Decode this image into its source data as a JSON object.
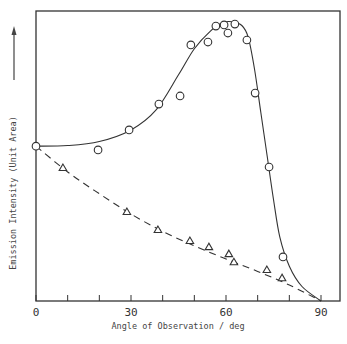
{
  "chart_data": {
    "type": "scatter",
    "title": "",
    "xlabel": "Angle of Observation / deg",
    "ylabel": "Emission Intensity (Unit Area)",
    "xlim": [
      0,
      90
    ],
    "ylim": [
      0,
      100
    ],
    "x_ticks": [
      0,
      10,
      20,
      30,
      40,
      50,
      60,
      70,
      80,
      90
    ],
    "x_tick_labels": [
      "0",
      "30",
      "60",
      "90"
    ],
    "y_ticks": [],
    "grid": false,
    "legend": null,
    "series": [
      {
        "name": "circles",
        "marker": "circle",
        "line": "solid",
        "points": [
          [
            0,
            53.4
          ],
          [
            19.6,
            52.1
          ],
          [
            29.4,
            59.0
          ],
          [
            38.8,
            67.9
          ],
          [
            45.5,
            70.7
          ],
          [
            48.9,
            88.3
          ],
          [
            54.3,
            89.3
          ],
          [
            56.8,
            94.8
          ],
          [
            59.4,
            95.2
          ],
          [
            60.6,
            92.4
          ],
          [
            62.8,
            95.5
          ],
          [
            66.6,
            90.0
          ],
          [
            69.2,
            71.7
          ],
          [
            73.6,
            46.2
          ],
          [
            78.0,
            15.2
          ]
        ],
        "fit_curve": [
          [
            0,
            53.4
          ],
          [
            10,
            53.6
          ],
          [
            20,
            55.0
          ],
          [
            30,
            59.0
          ],
          [
            38,
            66.0
          ],
          [
            45,
            78.0
          ],
          [
            50,
            87.0
          ],
          [
            55,
            93.0
          ],
          [
            59,
            96.0
          ],
          [
            62,
            96.3
          ],
          [
            65,
            95.0
          ],
          [
            67,
            91.0
          ],
          [
            69,
            80.0
          ],
          [
            71,
            65.0
          ],
          [
            73,
            50.0
          ],
          [
            75,
            35.0
          ],
          [
            77,
            22.0
          ],
          [
            80,
            12.0
          ],
          [
            84,
            5.0
          ],
          [
            90,
            0
          ]
        ]
      },
      {
        "name": "triangles",
        "marker": "triangle",
        "line": "dashed",
        "points": [
          [
            8.5,
            45.9
          ],
          [
            28.7,
            30.7
          ],
          [
            38.5,
            24.5
          ],
          [
            48.6,
            20.7
          ],
          [
            54.6,
            18.6
          ],
          [
            60.9,
            16.2
          ],
          [
            62.5,
            13.4
          ],
          [
            72.9,
            10.7
          ],
          [
            77.7,
            7.9
          ]
        ],
        "fit_curve": [
          [
            0,
            53.4
          ],
          [
            10,
            44.5
          ],
          [
            20,
            37.0
          ],
          [
            30,
            30.0
          ],
          [
            40,
            24.0
          ],
          [
            50,
            19.0
          ],
          [
            60,
            14.5
          ],
          [
            70,
            10.2
          ],
          [
            80,
            5.5
          ],
          [
            90,
            0
          ]
        ]
      }
    ],
    "annotations": [
      "y-axis arrow pointing up"
    ]
  },
  "caption_fragment": ""
}
